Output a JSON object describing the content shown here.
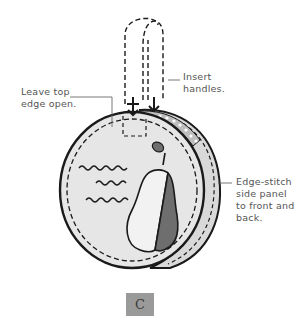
{
  "figure": {
    "step_label": "C",
    "annotations": {
      "insert_handles": [
        "Insert",
        "handles."
      ],
      "leave_top_open": [
        "Leave top",
        "edge open."
      ],
      "edge_stitch": [
        "Edge-stitch",
        "side panel",
        "to front and",
        "back."
      ]
    },
    "colors": {
      "outline": "#1a1a1a",
      "fabric": "#e6e6e6",
      "side_panel": "#d9d9d9",
      "pear_light": "#f2f2f2",
      "pear_dark": "#6e6e6e",
      "badge": "#9a9a9a",
      "label_text": "#555555"
    }
  }
}
